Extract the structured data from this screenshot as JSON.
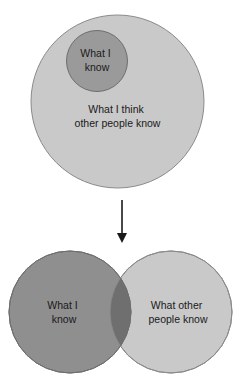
{
  "figure": {
    "background_color": "#ffffff",
    "text_color": "#1a1a1a"
  },
  "top_panel": {
    "name": "nested-circles-panel",
    "outer_circle": {
      "label_line1": "What I think",
      "label_line2": "other people know",
      "fill": "#c9c9c9",
      "stroke": "#8a8a8a",
      "cx": 117.5,
      "cy": 101.5,
      "r": 86.5
    },
    "inner_circle": {
      "label_line1": "What I",
      "label_line2": "know",
      "fill": "#9a9a9a",
      "stroke": "#6e6e6e",
      "cx": 97,
      "cy": 61,
      "r": 30.5
    }
  },
  "arrow": {
    "name": "downward-arrow",
    "color": "#1a1a1a",
    "x": 122,
    "y_start": 200,
    "y_end": 245
  },
  "bottom_panel": {
    "name": "venn-diagram-panel",
    "left_circle": {
      "label_line1": "What I",
      "label_line2": "know",
      "fill": "#8f8f8f",
      "stroke": "#6e6e6e",
      "cx": 70,
      "cy": 312,
      "r": 61
    },
    "right_circle": {
      "label_line1": "What other",
      "label_line2": "people know",
      "fill": "#c9c9c9",
      "stroke": "#8a8a8a",
      "cx": 171,
      "cy": 312,
      "r": 61
    },
    "overlap": {
      "name": "shared-knowledge-region",
      "fill": "#6f6f6f"
    }
  },
  "chart_data": {
    "type": "venn",
    "panels": [
      {
        "name": "perceived",
        "relation": "subset",
        "sets": [
          {
            "label": "What I think other people know",
            "role": "outer",
            "color": "#c9c9c9"
          },
          {
            "label": "What I know",
            "role": "inner",
            "color": "#9a9a9a"
          }
        ]
      },
      {
        "name": "actual",
        "relation": "partial-overlap",
        "sets": [
          {
            "label": "What I know",
            "role": "left",
            "color": "#8f8f8f"
          },
          {
            "label": "What other people know",
            "role": "right",
            "color": "#c9c9c9"
          }
        ],
        "intersection_color": "#6f6f6f"
      }
    ],
    "connector": "downward-arrow"
  }
}
